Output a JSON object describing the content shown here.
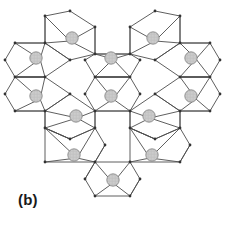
{
  "figure": {
    "panel_label": "(b)",
    "caption_text": "(b)",
    "background_color": "#ffffff",
    "edge_color": "#4d4d4d",
    "edge_width": 0.9,
    "vertex_color": "#333333",
    "atom_fill_color": "#cccccc",
    "atom_stroke_color": "#808080",
    "atom_radius": 6.2,
    "view_width": 225,
    "view_height": 227
  },
  "chart_data": {
    "type": "diagram",
    "title": "(b)",
    "xlabel": "",
    "ylabel": "",
    "units": "pixels",
    "xlim": [
      0,
      225
    ],
    "ylim": [
      0,
      227
    ],
    "grid": false,
    "legend": "none",
    "polyhedra": [
      {
        "id": "p-top-left",
        "center": [
          70,
          41
        ],
        "orientation": "vertical",
        "outline": [
          [
            45,
            16
          ],
          [
            70,
            11
          ],
          [
            95,
            27
          ],
          [
            95,
            54
          ],
          [
            70,
            60
          ],
          [
            45,
            43
          ]
        ],
        "spokes": [
          [
            45,
            16
          ],
          [
            95,
            27
          ],
          [
            95,
            54
          ],
          [
            45,
            43
          ]
        ],
        "atom": [
          72,
          38
        ]
      },
      {
        "id": "p-top-right",
        "center": [
          155,
          41
        ],
        "orientation": "vertical",
        "outline": [
          [
            130,
            27
          ],
          [
            155,
            11
          ],
          [
            180,
            16
          ],
          [
            180,
            43
          ],
          [
            155,
            60
          ],
          [
            130,
            54
          ]
        ],
        "spokes": [
          [
            130,
            27
          ],
          [
            180,
            16
          ],
          [
            180,
            43
          ],
          [
            130,
            54
          ]
        ],
        "atom": [
          153,
          38
        ]
      },
      {
        "id": "p-left-upper",
        "center": [
          40,
          59
        ],
        "orientation": "horizontal",
        "outline": [
          [
            15,
            43
          ],
          [
            45,
            43
          ],
          [
            70,
            60
          ],
          [
            45,
            77
          ],
          [
            15,
            77
          ],
          [
            5,
            60
          ]
        ],
        "spokes": [
          [
            15,
            43
          ],
          [
            45,
            43
          ],
          [
            45,
            77
          ],
          [
            15,
            77
          ]
        ],
        "atom": [
          36,
          58
        ]
      },
      {
        "id": "p-mid-upper",
        "center": [
          113,
          59
        ],
        "orientation": "horizontal",
        "outline": [
          [
            95,
            54
          ],
          [
            130,
            54
          ],
          [
            140,
            60
          ],
          [
            130,
            77
          ],
          [
            95,
            77
          ],
          [
            85,
            60
          ]
        ],
        "spokes": [
          [
            95,
            54
          ],
          [
            130,
            54
          ],
          [
            130,
            77
          ],
          [
            95,
            77
          ]
        ],
        "atom": [
          111,
          58
        ]
      },
      {
        "id": "p-right-upper",
        "center": [
          196,
          59
        ],
        "orientation": "horizontal",
        "outline": [
          [
            180,
            43
          ],
          [
            210,
            43
          ],
          [
            220,
            60
          ],
          [
            210,
            77
          ],
          [
            180,
            77
          ],
          [
            155,
            60
          ]
        ],
        "spokes": [
          [
            180,
            43
          ],
          [
            210,
            43
          ],
          [
            210,
            77
          ],
          [
            180,
            77
          ]
        ],
        "atom": [
          191,
          58
        ]
      },
      {
        "id": "p-left-lower",
        "center": [
          40,
          99
        ],
        "orientation": "horizontal",
        "outline": [
          [
            15,
            77
          ],
          [
            45,
            77
          ],
          [
            70,
            94
          ],
          [
            45,
            111
          ],
          [
            15,
            111
          ],
          [
            5,
            94
          ]
        ],
        "spokes": [
          [
            15,
            77
          ],
          [
            45,
            77
          ],
          [
            45,
            111
          ],
          [
            15,
            111
          ]
        ],
        "atom": [
          36,
          96
        ]
      },
      {
        "id": "p-mid-lower",
        "center": [
          113,
          99
        ],
        "orientation": "horizontal",
        "outline": [
          [
            95,
            77
          ],
          [
            130,
            77
          ],
          [
            140,
            94
          ],
          [
            130,
            111
          ],
          [
            95,
            111
          ],
          [
            85,
            94
          ]
        ],
        "spokes": [
          [
            95,
            77
          ],
          [
            130,
            77
          ],
          [
            130,
            111
          ],
          [
            95,
            111
          ]
        ],
        "atom": [
          111,
          96
        ]
      },
      {
        "id": "p-right-lower",
        "center": [
          196,
          99
        ],
        "orientation": "horizontal",
        "outline": [
          [
            180,
            77
          ],
          [
            210,
            77
          ],
          [
            220,
            94
          ],
          [
            210,
            111
          ],
          [
            180,
            111
          ],
          [
            155,
            94
          ]
        ],
        "spokes": [
          [
            180,
            77
          ],
          [
            210,
            77
          ],
          [
            210,
            111
          ],
          [
            180,
            111
          ]
        ],
        "atom": [
          191,
          96
        ]
      },
      {
        "id": "p-inner-left",
        "center": [
          77,
          118
        ],
        "orientation": "vertical",
        "outline": [
          [
            45,
            111
          ],
          [
            70,
            94
          ],
          [
            95,
            111
          ],
          [
            95,
            128
          ],
          [
            70,
            139
          ],
          [
            45,
            128
          ]
        ],
        "spokes": [
          [
            45,
            111
          ],
          [
            95,
            111
          ],
          [
            95,
            128
          ],
          [
            45,
            128
          ]
        ],
        "atom": [
          76,
          116
        ]
      },
      {
        "id": "p-inner-right",
        "center": [
          150,
          118
        ],
        "orientation": "vertical",
        "outline": [
          [
            130,
            111
          ],
          [
            155,
            94
          ],
          [
            180,
            111
          ],
          [
            180,
            128
          ],
          [
            155,
            139
          ],
          [
            130,
            128
          ]
        ],
        "spokes": [
          [
            130,
            111
          ],
          [
            180,
            111
          ],
          [
            180,
            128
          ],
          [
            130,
            128
          ]
        ],
        "atom": [
          149,
          116
        ]
      },
      {
        "id": "p-bottom-left",
        "center": [
          77,
          158
        ],
        "orientation": "horizontal",
        "outline": [
          [
            45,
            128
          ],
          [
            70,
            139
          ],
          [
            95,
            128
          ],
          [
            105,
            145
          ],
          [
            95,
            162
          ],
          [
            45,
            162
          ]
        ],
        "spokes": [
          [
            45,
            128
          ],
          [
            95,
            128
          ],
          [
            95,
            162
          ],
          [
            45,
            162
          ]
        ],
        "atom": [
          74,
          155
        ]
      },
      {
        "id": "p-bottom-right",
        "center": [
          150,
          158
        ],
        "orientation": "horizontal",
        "outline": [
          [
            130,
            128
          ],
          [
            155,
            139
          ],
          [
            180,
            128
          ],
          [
            190,
            145
          ],
          [
            180,
            162
          ],
          [
            130,
            162
          ]
        ],
        "spokes": [
          [
            130,
            128
          ],
          [
            180,
            128
          ],
          [
            180,
            162
          ],
          [
            130,
            162
          ]
        ],
        "atom": [
          152,
          155
        ]
      },
      {
        "id": "p-bottom-center",
        "center": [
          113,
          183
        ],
        "orientation": "vertical",
        "outline": [
          [
            95,
            162
          ],
          [
            130,
            162
          ],
          [
            140,
            179
          ],
          [
            130,
            196
          ],
          [
            95,
            196
          ],
          [
            85,
            179
          ]
        ],
        "spokes": [
          [
            95,
            162
          ],
          [
            130,
            162
          ],
          [
            130,
            196
          ],
          [
            95,
            196
          ]
        ],
        "atom": [
          113,
          180
        ]
      }
    ],
    "atoms": [
      [
        72,
        38
      ],
      [
        153,
        38
      ],
      [
        36,
        58
      ],
      [
        111,
        58
      ],
      [
        191,
        58
      ],
      [
        36,
        96
      ],
      [
        111,
        96
      ],
      [
        191,
        96
      ],
      [
        76,
        116
      ],
      [
        149,
        116
      ],
      [
        74,
        155
      ],
      [
        152,
        155
      ],
      [
        113,
        180
      ]
    ],
    "vertices": [
      [
        45,
        16
      ],
      [
        70,
        11
      ],
      [
        95,
        27
      ],
      [
        130,
        27
      ],
      [
        155,
        11
      ],
      [
        180,
        16
      ],
      [
        15,
        43
      ],
      [
        45,
        43
      ],
      [
        95,
        54
      ],
      [
        130,
        54
      ],
      [
        180,
        43
      ],
      [
        210,
        43
      ],
      [
        5,
        60
      ],
      [
        70,
        60
      ],
      [
        85,
        60
      ],
      [
        140,
        60
      ],
      [
        155,
        60
      ],
      [
        220,
        60
      ],
      [
        15,
        77
      ],
      [
        45,
        77
      ],
      [
        95,
        77
      ],
      [
        130,
        77
      ],
      [
        180,
        77
      ],
      [
        210,
        77
      ],
      [
        5,
        94
      ],
      [
        70,
        94
      ],
      [
        85,
        94
      ],
      [
        140,
        94
      ],
      [
        155,
        94
      ],
      [
        220,
        94
      ],
      [
        15,
        111
      ],
      [
        45,
        111
      ],
      [
        95,
        111
      ],
      [
        130,
        111
      ],
      [
        180,
        111
      ],
      [
        210,
        111
      ],
      [
        45,
        128
      ],
      [
        95,
        128
      ],
      [
        130,
        128
      ],
      [
        180,
        128
      ],
      [
        70,
        139
      ],
      [
        155,
        139
      ],
      [
        45,
        162
      ],
      [
        95,
        162
      ],
      [
        105,
        145
      ],
      [
        130,
        162
      ],
      [
        190,
        145
      ],
      [
        180,
        162
      ],
      [
        85,
        179
      ],
      [
        140,
        179
      ],
      [
        95,
        196
      ],
      [
        130,
        196
      ]
    ],
    "hexagonal_voids": [
      {
        "id": "void-left",
        "center": [
          70,
          77
        ]
      },
      {
        "id": "void-right",
        "center": [
          155,
          77
        ]
      },
      {
        "id": "void-bottom",
        "center": [
          113,
          128
        ]
      }
    ]
  }
}
